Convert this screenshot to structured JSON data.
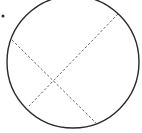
{
  "diagram": {
    "type": "geometry",
    "stroke_color": "#2a2a2a",
    "dash_color": "#555555",
    "circle": {
      "cx": 73,
      "cy": 62,
      "r": 66
    },
    "point": {
      "x": 3,
      "y": 16,
      "r": 1.5
    },
    "chords": [
      {
        "x1": 12,
        "y1": 40,
        "x2": 97,
        "y2": 124
      },
      {
        "x1": 118,
        "y1": 14,
        "x2": 29,
        "y2": 106
      }
    ]
  }
}
